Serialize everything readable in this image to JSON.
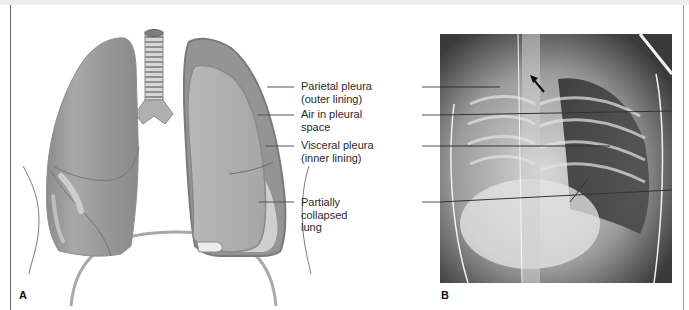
{
  "figure": {
    "panel_a": {
      "letter": "A",
      "description": "Illustration of lungs showing pneumothorax with partially collapsed left lung"
    },
    "panel_b": {
      "letter": "B",
      "description": "Chest X-ray showing pneumothorax; arrow marker pointing at trachea region"
    },
    "labels": [
      {
        "line1": "Parietal pleura",
        "line2": "(outer lining)"
      },
      {
        "line1": "Air in pleural",
        "line2": "space"
      },
      {
        "line1": "Visceral pleura",
        "line2": "(inner lining)"
      },
      {
        "line1": "Partially",
        "line2": "collapsed",
        "line3": "lung"
      }
    ],
    "colors": {
      "lung_dark": "#8e8e8e",
      "lung_mid": "#a4a4a4",
      "lung_light": "#c6c6c6",
      "pleura_outline": "#8a8a8a",
      "leader_line": "#555555",
      "frame": "#6a6a6a"
    }
  }
}
